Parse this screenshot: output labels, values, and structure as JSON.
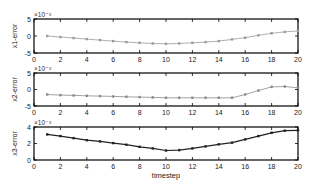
{
  "chart_data": [
    {
      "type": "line",
      "title": "",
      "xlabel": "",
      "ylabel": "x1-error",
      "y_scale_label": "×10⁻³",
      "xlim": [
        0,
        20
      ],
      "ylim": [
        -5,
        5
      ],
      "xticks": [
        0,
        2,
        4,
        6,
        8,
        10,
        12,
        14,
        16,
        18,
        20
      ],
      "yticks": [
        -5,
        0,
        5
      ],
      "color": "#9a9a9a",
      "x": [
        1,
        2,
        3,
        4,
        5,
        6,
        7,
        8,
        9,
        10,
        11,
        12,
        13,
        14,
        15,
        16,
        17,
        18,
        19,
        20
      ],
      "values": [
        0.0,
        -0.3,
        -0.6,
        -0.9,
        -1.2,
        -1.5,
        -1.8,
        -2.0,
        -2.2,
        -2.3,
        -2.2,
        -2.0,
        -1.8,
        -1.5,
        -1.0,
        -0.5,
        0.2,
        0.8,
        1.2,
        1.5
      ]
    },
    {
      "type": "line",
      "title": "",
      "xlabel": "",
      "ylabel": "x2-error",
      "y_scale_label": "×10⁻³",
      "xlim": [
        0,
        20
      ],
      "ylim": [
        -5,
        5
      ],
      "xticks": [
        0,
        2,
        4,
        6,
        8,
        10,
        12,
        14,
        16,
        18,
        20
      ],
      "yticks": [
        -5,
        0,
        5
      ],
      "color": "#8a8a8a",
      "x": [
        1,
        2,
        3,
        4,
        5,
        6,
        7,
        8,
        9,
        10,
        11,
        12,
        13,
        14,
        15,
        16,
        17,
        18,
        19,
        20
      ],
      "values": [
        -1.5,
        -1.7,
        -1.8,
        -1.9,
        -2.0,
        -2.1,
        -2.2,
        -2.3,
        -2.4,
        -2.5,
        -2.5,
        -2.5,
        -2.5,
        -2.5,
        -2.5,
        -1.5,
        -0.3,
        0.8,
        0.9,
        0.5
      ]
    },
    {
      "type": "line",
      "title": "",
      "xlabel": "timestep",
      "ylabel": "x3-error",
      "y_scale_label": "×10⁻³",
      "xlim": [
        0,
        20
      ],
      "ylim": [
        0,
        4
      ],
      "xticks": [
        0,
        2,
        4,
        6,
        8,
        10,
        12,
        14,
        16,
        18,
        20
      ],
      "yticks": [
        0,
        2,
        4
      ],
      "color": "#222222",
      "x": [
        1,
        2,
        3,
        4,
        5,
        6,
        7,
        8,
        9,
        10,
        11,
        12,
        13,
        14,
        15,
        16,
        17,
        18,
        19,
        20
      ],
      "values": [
        3.1,
        2.9,
        2.65,
        2.4,
        2.25,
        2.05,
        1.85,
        1.6,
        1.4,
        1.15,
        1.2,
        1.4,
        1.65,
        1.9,
        2.1,
        2.5,
        2.9,
        3.3,
        3.55,
        3.6
      ]
    }
  ]
}
